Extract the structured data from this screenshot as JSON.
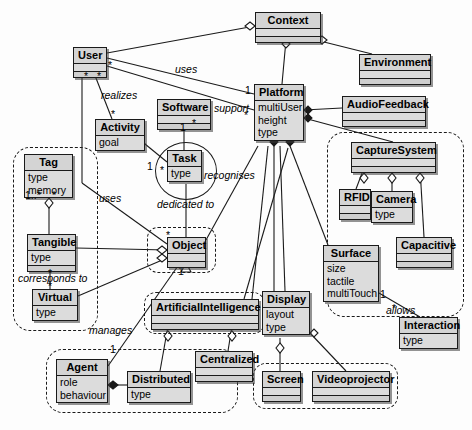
{
  "diagram": {
    "type": "uml-class-diagram",
    "colors": {
      "box_fill": "#d4d4d4",
      "attr_fill": "#dcdcdc",
      "stroke": "#1a1a1a",
      "background": "#fdfdfd"
    }
  },
  "classes": [
    {
      "id": "context",
      "name": "Context",
      "attributes": [],
      "x": 255,
      "y": 12,
      "w": 66,
      "shadow": true
    },
    {
      "id": "user",
      "name": "User",
      "attributes": [],
      "x": 73,
      "y": 47,
      "w": 34,
      "shadow": true
    },
    {
      "id": "environment",
      "name": "Environment",
      "attributes": [],
      "x": 359,
      "y": 54,
      "w": 72,
      "shadow": true
    },
    {
      "id": "platform",
      "name": "Platform",
      "attributes": [
        "multiUser",
        "height",
        "type"
      ],
      "x": 254,
      "y": 84,
      "w": 50,
      "shadow": true
    },
    {
      "id": "software",
      "name": "Software",
      "attributes": [],
      "x": 157,
      "y": 99,
      "w": 54,
      "shadow": true
    },
    {
      "id": "audio",
      "name": "AudioFeedback",
      "attributes": [],
      "x": 342,
      "y": 96,
      "w": 84,
      "shadow": true
    },
    {
      "id": "activity",
      "name": "Activity",
      "attributes": [
        "goal"
      ],
      "x": 95,
      "y": 119,
      "w": 50,
      "shadow": true
    },
    {
      "id": "capture",
      "name": "CaptureSystem",
      "attributes": [],
      "x": 351,
      "y": 142,
      "w": 85,
      "shadow": true
    },
    {
      "id": "task",
      "name": "Task",
      "attributes": [
        "type"
      ],
      "x": 167,
      "y": 150,
      "w": 35,
      "shadow": true
    },
    {
      "id": "tag",
      "name": "Tag",
      "attributes": [
        "type",
        "memory"
      ],
      "x": 24,
      "y": 154,
      "w": 49,
      "shadow": true
    },
    {
      "id": "rfid",
      "name": "RFID",
      "attributes": [],
      "x": 339,
      "y": 189,
      "w": 32,
      "shadow": true
    },
    {
      "id": "camera",
      "name": "Camera",
      "attributes": [
        "type"
      ],
      "x": 371,
      "y": 191,
      "w": 42,
      "shadow": true
    },
    {
      "id": "tangible",
      "name": "Tangible",
      "attributes": [
        "type"
      ],
      "x": 27,
      "y": 234,
      "w": 49,
      "shadow": true
    },
    {
      "id": "object",
      "name": "Object",
      "attributes": [],
      "x": 167,
      "y": 237,
      "w": 39,
      "shadow": true
    },
    {
      "id": "capacitive",
      "name": "Capacitive",
      "attributes": [],
      "x": 396,
      "y": 237,
      "w": 56,
      "shadow": true
    },
    {
      "id": "surface",
      "name": "Surface",
      "attributes": [
        "size",
        "tactile",
        "multiTouch"
      ],
      "x": 323,
      "y": 245,
      "w": 56,
      "shadow": true
    },
    {
      "id": "virtual",
      "name": "Virtual",
      "attributes": [
        "type"
      ],
      "x": 32,
      "y": 289,
      "w": 46,
      "shadow": true
    },
    {
      "id": "display",
      "name": "Display",
      "attributes": [
        "layout",
        "type"
      ],
      "x": 262,
      "y": 291,
      "w": 48,
      "shadow": true
    },
    {
      "id": "ai",
      "name": "ArtificialIntelligence",
      "attributes": [],
      "x": 151,
      "y": 299,
      "w": 108,
      "shadow": true
    },
    {
      "id": "interaction",
      "name": "Interaction",
      "attributes": [
        "type"
      ],
      "x": 399,
      "y": 317,
      "w": 59,
      "shadow": true
    },
    {
      "id": "centralized",
      "name": "Centralized",
      "attributes": [],
      "x": 195,
      "y": 351,
      "w": 58,
      "shadow": true
    },
    {
      "id": "agent",
      "name": "Agent",
      "attributes": [
        "role",
        "behaviour"
      ],
      "x": 56,
      "y": 359,
      "w": 52,
      "shadow": true
    },
    {
      "id": "distributed",
      "name": "Distributed",
      "attributes": [
        "type"
      ],
      "x": 127,
      "y": 371,
      "w": 64,
      "shadow": true
    },
    {
      "id": "screen",
      "name": "Screen",
      "attributes": [],
      "x": 262,
      "y": 371,
      "w": 39,
      "shadow": true
    },
    {
      "id": "videoproj",
      "name": "Videoprojector",
      "attributes": [],
      "x": 312,
      "y": 371,
      "w": 78,
      "shadow": true
    }
  ],
  "groups": [
    {
      "id": "grp-tangible-virtual",
      "x": 13,
      "y": 147,
      "w": 85,
      "h": 184
    },
    {
      "id": "grp-object",
      "x": 147,
      "y": 227,
      "w": 69,
      "h": 46
    },
    {
      "id": "grp-capture",
      "x": 327,
      "y": 132,
      "w": 137,
      "h": 185
    },
    {
      "id": "grp-ai",
      "x": 144,
      "y": 292,
      "w": 121,
      "h": 42
    },
    {
      "id": "grp-agent",
      "x": 46,
      "y": 349,
      "w": 192,
      "h": 64
    },
    {
      "id": "grp-screen",
      "x": 253,
      "y": 363,
      "w": 145,
      "h": 46
    }
  ],
  "ellipses": [
    {
      "id": "ellipse-task",
      "x": 155,
      "y": 142,
      "w": 62,
      "h": 58
    }
  ],
  "relation_labels": [
    {
      "id": "lbl-uses-user-platform",
      "text": "uses",
      "x": 175,
      "y": 64,
      "italic": true
    },
    {
      "id": "lbl-realizes",
      "text": "realizes",
      "x": 101,
      "y": 90,
      "italic": true
    },
    {
      "id": "lbl-support",
      "text": "support",
      "x": 214,
      "y": 103,
      "italic": true
    },
    {
      "id": "lbl-recognises",
      "text": "recognises",
      "x": 204,
      "y": 170,
      "italic": true
    },
    {
      "id": "lbl-uses-tag-object",
      "text": "uses",
      "x": 99,
      "y": 193,
      "italic": true
    },
    {
      "id": "lbl-dedicated-to",
      "text": "dedicated to",
      "x": 157,
      "y": 199,
      "italic": true
    },
    {
      "id": "lbl-allows",
      "text": "allows",
      "x": 386,
      "y": 305,
      "italic": true
    },
    {
      "id": "lbl-corresponds-to",
      "text": "corresponds to",
      "x": 18,
      "y": 273,
      "italic": true
    },
    {
      "id": "lbl-manages",
      "text": "manages",
      "x": 89,
      "y": 325,
      "italic": true
    }
  ],
  "multiplicities": [
    {
      "id": "mult-user-a",
      "text": "*",
      "x": 84,
      "y": 73
    },
    {
      "id": "mult-user-b",
      "text": "*",
      "x": 97,
      "y": 73
    },
    {
      "id": "mult-user-c",
      "text": "*",
      "x": 108,
      "y": 62
    },
    {
      "id": "mult-activity",
      "text": "*",
      "x": 111,
      "y": 111
    },
    {
      "id": "mult-software-1",
      "text": "1",
      "x": 180,
      "y": 123
    },
    {
      "id": "mult-platform-1",
      "text": "1",
      "x": 246,
      "y": 87
    },
    {
      "id": "mult-support-dot",
      "text": "*",
      "x": 192,
      "y": 120
    },
    {
      "id": "mult-platform-s",
      "text": "*",
      "x": 244,
      "y": 112
    },
    {
      "id": "mult-task-dot",
      "text": "*",
      "x": 160,
      "y": 167
    },
    {
      "id": "mult-activity-1",
      "text": "1",
      "x": 147,
      "y": 163
    },
    {
      "id": "mult-tag",
      "text": "1..*",
      "x": 25,
      "y": 192
    },
    {
      "id": "mult-tag-dot",
      "text": "*",
      "x": 50,
      "y": 192
    },
    {
      "id": "mult-object-star",
      "text": "*",
      "x": 166,
      "y": 232
    },
    {
      "id": "mult-object-1",
      "text": "1",
      "x": 178,
      "y": 266
    },
    {
      "id": "mult-tangible-d",
      "text": "*",
      "x": 48,
      "y": 271
    },
    {
      "id": "mult-virtual-d",
      "text": "*",
      "x": 48,
      "y": 284
    },
    {
      "id": "mult-surface-1",
      "text": "1",
      "x": 380,
      "y": 290
    },
    {
      "id": "mult-interact-d",
      "text": "*",
      "x": 392,
      "y": 306
    },
    {
      "id": "mult-agent-1",
      "text": "1",
      "x": 110,
      "y": 346
    }
  ]
}
